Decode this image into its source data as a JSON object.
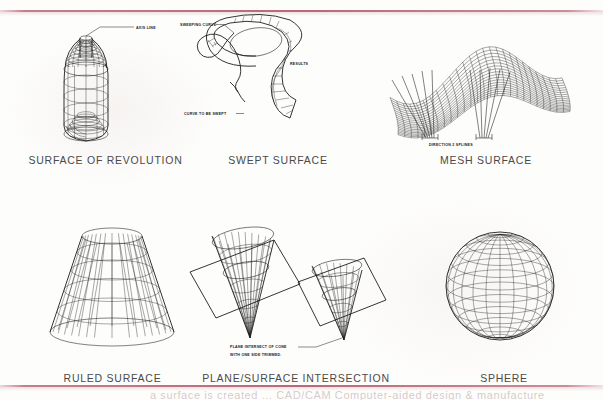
{
  "page": {
    "kind": "scanned-reference-page",
    "ink_color": "#1a1a1a",
    "paper_color": "#fdfdfc",
    "rule_color": "#b25c6e",
    "caption_color": "#4a4a4a",
    "bottom_cropped_text": "a surface is created ... CAD/CAM Computer-aided design & manufacture"
  },
  "figures": [
    {
      "id": "surface-of-revolution",
      "caption": "SURFACE OF REVOLUTION",
      "row": 1,
      "column": 1,
      "annotations": [
        {
          "id": "axis-line",
          "text": "AXIS LINE"
        }
      ]
    },
    {
      "id": "swept-surface",
      "caption": "SWEPT SURFACE",
      "row": 1,
      "column": 2,
      "annotations": [
        {
          "id": "sweeping-curve",
          "text": "SWEEPING CURVE"
        },
        {
          "id": "curve-to-be-swept",
          "text": "CURVE TO BE SWEPT"
        },
        {
          "id": "results",
          "text": "RESULTS"
        }
      ]
    },
    {
      "id": "mesh-surface",
      "caption": "MESH SURFACE",
      "row": 1,
      "column": 3,
      "annotations": [
        {
          "id": "direction-2-splines",
          "text": "DIRECTION 2 SPLINES"
        }
      ]
    },
    {
      "id": "ruled-surface",
      "caption": "RULED SURFACE",
      "row": 2,
      "column": 1,
      "annotations": []
    },
    {
      "id": "plane-surface-intersection",
      "caption": "PLANE/SURFACE INTERSECTION",
      "row": 2,
      "column": 2,
      "annotations": [
        {
          "id": "plane-intersect-of-cone",
          "text": "PLANE INTERSECT OF CONE"
        },
        {
          "id": "with-one-side-trimmed",
          "text": "WITH ONE SIDE TRIMMED."
        }
      ]
    },
    {
      "id": "sphere",
      "caption": "SPHERE",
      "row": 2,
      "column": 3,
      "annotations": []
    }
  ]
}
